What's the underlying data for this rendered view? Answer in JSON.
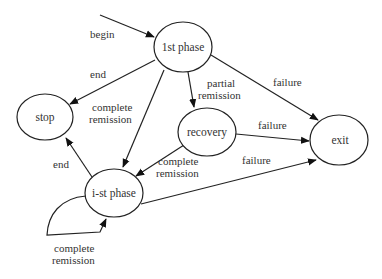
{
  "diagram": {
    "type": "state-transition",
    "nodes": {
      "first_phase": {
        "label": "1st phase",
        "cx": 183,
        "cy": 47,
        "rx": 29,
        "ry": 25
      },
      "stop": {
        "label": "stop",
        "cx": 45,
        "cy": 117,
        "rx": 28,
        "ry": 23
      },
      "recovery": {
        "label": "recovery",
        "cx": 207,
        "cy": 132,
        "rx": 29,
        "ry": 24
      },
      "exit": {
        "label": "exit",
        "cx": 339,
        "cy": 140,
        "rx": 29,
        "ry": 25
      },
      "ist_phase": {
        "label": "i-st phase",
        "cx": 114,
        "cy": 193,
        "rx": 29,
        "ry": 24
      }
    },
    "edges": {
      "begin": {
        "from": "start",
        "to": "1st phase",
        "label": "begin"
      },
      "first_end": {
        "from": "1st phase",
        "to": "stop",
        "label": "end"
      },
      "first_complete": {
        "from": "1st phase",
        "to": "i-st phase",
        "label_line1": "complete",
        "label_line2": "remission"
      },
      "first_partial": {
        "from": "1st phase",
        "to": "recovery",
        "label_line1": "partial",
        "label_line2": "remission"
      },
      "first_failure": {
        "from": "1st phase",
        "to": "exit",
        "label": "failure"
      },
      "recovery_failure": {
        "from": "recovery",
        "to": "exit",
        "label": "failure"
      },
      "recovery_complete": {
        "from": "recovery",
        "to": "i-st phase",
        "label_line1": "complete",
        "label_line2": "remission"
      },
      "ist_end": {
        "from": "i-st phase",
        "to": "stop",
        "label": "end"
      },
      "ist_failure": {
        "from": "i-st phase",
        "to": "exit",
        "label": "failure"
      },
      "ist_self": {
        "from": "i-st phase",
        "to": "i-st phase",
        "label_line1": "complete",
        "label_line2": "remission"
      }
    }
  }
}
